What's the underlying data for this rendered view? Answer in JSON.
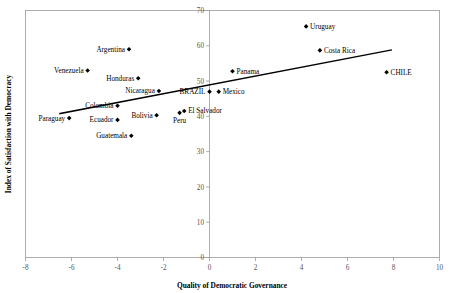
{
  "chart_data": {
    "type": "scatter",
    "title": "",
    "xlabel": "Quality of Democratic Governance",
    "ylabel": "Index of Satisfaction with Democracy",
    "xlim": [
      -8,
      10
    ],
    "ylim": [
      0,
      70
    ],
    "xticks": [
      "-8",
      "-6",
      "-4",
      "-2",
      "0",
      "2",
      "4",
      "6",
      "8",
      "10"
    ],
    "xtick_values": [
      -8,
      -6,
      -4,
      -2,
      0,
      2,
      4,
      6,
      8,
      10
    ],
    "yticks": [
      "0",
      "10",
      "20",
      "30",
      "40",
      "50",
      "60",
      "70"
    ],
    "ytick_values": [
      0,
      10,
      20,
      30,
      40,
      50,
      60,
      70
    ],
    "grid": false,
    "legend": "none",
    "points": [
      {
        "label": "Uruguay",
        "x": 4.2,
        "y": 65.5,
        "label_pos": "right"
      },
      {
        "label": "Costa Rica",
        "x": 4.8,
        "y": 58.7,
        "label_pos": "right"
      },
      {
        "label": "CHILE",
        "x": 7.7,
        "y": 52.5,
        "label_pos": "right"
      },
      {
        "label": "Panama",
        "x": 1.0,
        "y": 52.8,
        "label_pos": "right"
      },
      {
        "label": "Mexico",
        "x": 0.4,
        "y": 47.0,
        "label_pos": "right"
      },
      {
        "label": "BRAZIL",
        "x": 0.0,
        "y": 47.0,
        "label_pos": "left"
      },
      {
        "label": "Argentina",
        "x": -3.5,
        "y": 59.0,
        "label_pos": "left"
      },
      {
        "label": "Venezuela",
        "x": -5.3,
        "y": 53.0,
        "label_pos": "left"
      },
      {
        "label": "Honduras",
        "x": -3.1,
        "y": 50.8,
        "label_pos": "left"
      },
      {
        "label": "Nicaragua",
        "x": -2.2,
        "y": 47.2,
        "label_pos": "left"
      },
      {
        "label": "Colombia",
        "x": -4.0,
        "y": 43.0,
        "label_pos": "left"
      },
      {
        "label": "El Salvador",
        "x": -1.1,
        "y": 41.5,
        "label_pos": "right"
      },
      {
        "label": "Peru",
        "x": -1.3,
        "y": 41.0,
        "label_pos": "below"
      },
      {
        "label": "Bolivia",
        "x": -2.3,
        "y": 40.3,
        "label_pos": "left"
      },
      {
        "label": "Ecuador",
        "x": -4.0,
        "y": 39.0,
        "label_pos": "left"
      },
      {
        "label": "Paraguay",
        "x": -6.1,
        "y": 39.5,
        "label_pos": "left"
      },
      {
        "label": "Guatemala",
        "x": -3.4,
        "y": 34.5,
        "label_pos": "left"
      }
    ],
    "trendline": {
      "x_start": -6.5,
      "y_start": 40.8,
      "x_end": 7.9,
      "y_end": 58.8,
      "color": "#000000"
    }
  }
}
